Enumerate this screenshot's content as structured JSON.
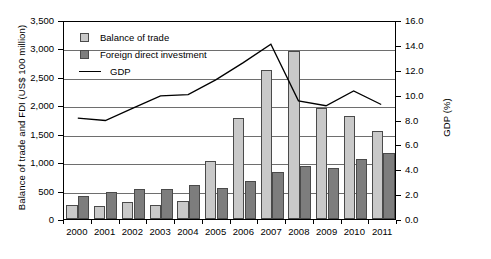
{
  "chart_data": {
    "type": "bar",
    "title": "",
    "xlabel": "",
    "ylabel": "Balance of trade and FDI (US$ 100 million)",
    "y2label": "GDP (%)",
    "categories": [
      "2000",
      "2001",
      "2002",
      "2003",
      "2004",
      "2005",
      "2006",
      "2007",
      "2008",
      "2009",
      "2010",
      "2011"
    ],
    "ylim": [
      0,
      3500
    ],
    "yticks": [
      0,
      500,
      1000,
      1500,
      2000,
      2500,
      3000,
      3500
    ],
    "ytick_labels": [
      "0",
      "500",
      "1,000",
      "1,500",
      "2,000",
      "2,500",
      "3,000",
      "3,500"
    ],
    "y2lim": [
      0,
      16
    ],
    "y2ticks": [
      0,
      2,
      4,
      6,
      8,
      10,
      12,
      14,
      16
    ],
    "y2tick_labels": [
      "0.0",
      "2.0",
      "4.0",
      "6.0",
      "8.0",
      "10.0",
      "12.0",
      "14.0",
      "16.0"
    ],
    "grid": true,
    "legend_position": "upper-left",
    "series": [
      {
        "name": "Balance of trade",
        "kind": "bar",
        "axis": "left",
        "color": "#c9c9c9",
        "values": [
          245,
          225,
          305,
          255,
          320,
          1020,
          1775,
          2620,
          2955,
          1960,
          1815,
          1550
        ]
      },
      {
        "name": "Foreign direct investment",
        "kind": "bar",
        "axis": "left",
        "color": "#7d7d7d",
        "values": [
          410,
          470,
          530,
          535,
          605,
          545,
          670,
          825,
          925,
          900,
          1060,
          1160
        ]
      },
      {
        "name": "GDP",
        "kind": "line",
        "axis": "right",
        "color": "#000000",
        "values": [
          8.2,
          8.0,
          9.0,
          10.0,
          10.1,
          11.3,
          12.7,
          14.2,
          9.6,
          9.2,
          10.4,
          9.3
        ]
      }
    ]
  },
  "legend": {
    "items": [
      {
        "label": "Balance of trade",
        "marker": "square-light"
      },
      {
        "label": "Foreign direct investment",
        "marker": "square-dark"
      },
      {
        "label": "GDP",
        "marker": "line"
      }
    ]
  }
}
